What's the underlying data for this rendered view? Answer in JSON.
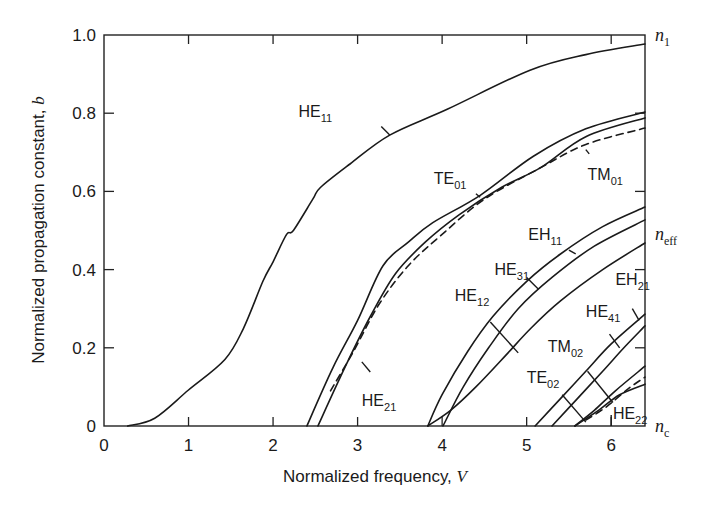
{
  "chart_data": {
    "type": "line",
    "title": "",
    "xlabel": "Normalized frequency, V",
    "ylabel": "Normalized propagation constant, b",
    "xlabel_parts": {
      "text": "Normalized frequency, ",
      "var": "V"
    },
    "ylabel_parts": {
      "text": "Normalized propagation constant, ",
      "var": "b"
    },
    "xlim": [
      0,
      6.4
    ],
    "ylim": [
      0,
      1.0
    ],
    "grid": false,
    "legend": "none (inline mode labels)",
    "x_ticks": [
      0,
      1,
      2,
      3,
      4,
      5,
      6
    ],
    "x_tick_labels": [
      "0",
      "1",
      "2",
      "3",
      "4",
      "5",
      "6"
    ],
    "y_ticks": [
      0,
      0.2,
      0.4,
      0.6,
      0.8,
      1.0
    ],
    "y_tick_labels": [
      "0",
      "0.2",
      "0.4",
      "0.6",
      "0.8",
      "1.0"
    ],
    "right_axis_labels": [
      {
        "base": "n",
        "sub": "1",
        "b": 1.0
      },
      {
        "base": "n",
        "sub": "eff",
        "b": 0.49
      },
      {
        "base": "n",
        "sub": "c",
        "b": 0.0
      }
    ],
    "series": [
      {
        "name": "HE11",
        "style": "solid",
        "cutoff_V": 0.28,
        "points": [
          [
            0.28,
            0
          ],
          [
            0.6,
            0.02
          ],
          [
            1.0,
            0.092
          ],
          [
            1.43,
            0.17
          ],
          [
            1.65,
            0.25
          ],
          [
            1.88,
            0.37
          ],
          [
            2.0,
            0.42
          ],
          [
            2.16,
            0.49
          ],
          [
            2.24,
            0.5
          ],
          [
            2.47,
            0.58
          ],
          [
            2.56,
            0.61
          ],
          [
            2.91,
            0.67
          ],
          [
            3.38,
            0.744
          ],
          [
            4.06,
            0.81
          ],
          [
            5.04,
            0.91
          ],
          [
            5.7,
            0.95
          ],
          [
            6.4,
            0.977
          ]
        ]
      },
      {
        "name": "TE01",
        "style": "solid",
        "cutoff_V": 2.4,
        "points": [
          [
            2.4,
            0
          ],
          [
            2.71,
            0.15
          ],
          [
            3.0,
            0.27
          ],
          [
            3.3,
            0.41
          ],
          [
            3.6,
            0.47
          ],
          [
            3.89,
            0.52
          ],
          [
            4.45,
            0.59
          ],
          [
            5.08,
            0.69
          ],
          [
            5.7,
            0.76
          ],
          [
            6.4,
            0.803
          ]
        ]
      },
      {
        "name": "HE21",
        "style": "solid",
        "cutoff_V": 2.53,
        "points": [
          [
            2.53,
            0
          ],
          [
            2.85,
            0.15
          ],
          [
            3.15,
            0.28
          ],
          [
            3.45,
            0.39
          ],
          [
            3.8,
            0.47
          ],
          [
            4.2,
            0.54
          ],
          [
            4.7,
            0.61
          ],
          [
            5.16,
            0.66
          ],
          [
            5.7,
            0.74
          ],
          [
            6.4,
            0.788
          ]
        ]
      },
      {
        "name": "TM01",
        "style": "dashed",
        "cutoff_V": 2.68,
        "points": [
          [
            2.68,
            0.09
          ],
          [
            2.95,
            0.19
          ],
          [
            3.25,
            0.31
          ],
          [
            3.6,
            0.41
          ],
          [
            4.0,
            0.49
          ],
          [
            4.5,
            0.58
          ],
          [
            5.16,
            0.66
          ],
          [
            5.7,
            0.72
          ],
          [
            6.4,
            0.762
          ]
        ]
      },
      {
        "name": "EH11",
        "style": "solid",
        "cutoff_V": 3.83,
        "points": [
          [
            3.83,
            0
          ],
          [
            4.0,
            0.08
          ],
          [
            4.3,
            0.19
          ],
          [
            4.6,
            0.28
          ],
          [
            5.0,
            0.37
          ],
          [
            5.4,
            0.44
          ],
          [
            5.9,
            0.51
          ],
          [
            6.4,
            0.56
          ]
        ]
      },
      {
        "name": "HE31",
        "style": "solid",
        "cutoff_V": 4.01,
        "points": [
          [
            4.01,
            0
          ],
          [
            4.25,
            0.1
          ],
          [
            4.55,
            0.2
          ],
          [
            4.9,
            0.3
          ],
          [
            5.3,
            0.38
          ],
          [
            5.8,
            0.46
          ],
          [
            6.4,
            0.527
          ]
        ]
      },
      {
        "name": "HE12",
        "style": "solid",
        "cutoff_V": 3.83,
        "points": [
          [
            3.83,
            0
          ],
          [
            4.1,
            0.04
          ],
          [
            4.4,
            0.1
          ],
          [
            4.75,
            0.18
          ],
          [
            5.05,
            0.25
          ],
          [
            5.4,
            0.32
          ],
          [
            5.9,
            0.4
          ],
          [
            6.4,
            0.468
          ]
        ]
      },
      {
        "name": "EH21",
        "style": "solid",
        "cutoff_V": 5.1,
        "points": [
          [
            5.1,
            0
          ],
          [
            5.4,
            0.07
          ],
          [
            5.7,
            0.14
          ],
          [
            6.0,
            0.21
          ],
          [
            6.4,
            0.286
          ]
        ]
      },
      {
        "name": "HE41",
        "style": "solid",
        "cutoff_V": 5.3,
        "points": [
          [
            5.3,
            0
          ],
          [
            5.6,
            0.07
          ],
          [
            5.9,
            0.14
          ],
          [
            6.15,
            0.2
          ],
          [
            6.4,
            0.256
          ]
        ]
      },
      {
        "name": "TM02",
        "style": "solid",
        "cutoff_V": 5.57,
        "points": [
          [
            5.57,
            0
          ],
          [
            5.8,
            0.04
          ],
          [
            6.05,
            0.09
          ],
          [
            6.4,
            0.153
          ]
        ]
      },
      {
        "name": "TE02",
        "style": "solid",
        "cutoff_V": 5.57,
        "points": [
          [
            5.57,
            0
          ],
          [
            5.85,
            0.04
          ],
          [
            6.1,
            0.08
          ],
          [
            6.4,
            0.107
          ]
        ]
      },
      {
        "name": "HE22",
        "style": "dashed",
        "cutoff_V": 5.7,
        "points": [
          [
            5.7,
            0.015
          ],
          [
            5.95,
            0.05
          ],
          [
            6.2,
            0.095
          ],
          [
            6.4,
            0.125
          ]
        ]
      }
    ],
    "annotations": [
      {
        "text": "HE11",
        "base": "HE",
        "sub": "11",
        "label_at": [
          2.3,
          0.79
        ],
        "leader": [
          [
            3.28,
            0.766
          ],
          [
            3.38,
            0.744
          ]
        ]
      },
      {
        "text": "TE01",
        "base": "TE",
        "sub": "01",
        "label_at": [
          3.9,
          0.62
        ],
        "leader": [
          [
            4.4,
            0.594
          ],
          [
            4.45,
            0.585
          ]
        ]
      },
      {
        "text": "TM01",
        "base": "TM",
        "sub": "01",
        "label_at": [
          5.72,
          0.63
        ],
        "leader": [
          [
            5.7,
            0.707
          ],
          [
            5.74,
            0.696
          ]
        ]
      },
      {
        "text": "HE21",
        "base": "HE",
        "sub": "21",
        "label_at": [
          3.05,
          0.05
        ],
        "leader": [
          [
            3.05,
            0.164
          ],
          [
            3.15,
            0.138
          ]
        ]
      },
      {
        "text": "EH11",
        "base": "EH",
        "sub": "11",
        "label_at": [
          5.02,
          0.475
        ],
        "leader": [
          [
            5.5,
            0.45
          ],
          [
            5.58,
            0.44
          ]
        ]
      },
      {
        "text": "HE31",
        "base": "HE",
        "sub": "31",
        "label_at": [
          4.62,
          0.385
        ],
        "leader": [
          [
            5.0,
            0.38
          ],
          [
            5.14,
            0.35
          ]
        ]
      },
      {
        "text": "HE12",
        "base": "HE",
        "sub": "12",
        "label_at": [
          4.15,
          0.32
        ],
        "leader": [
          [
            4.57,
            0.266
          ],
          [
            4.9,
            0.187
          ]
        ]
      },
      {
        "text": "EH21",
        "base": "EH",
        "sub": "21",
        "label_at": [
          6.05,
          0.36
        ],
        "leader": [
          [
            6.25,
            0.3
          ],
          [
            6.33,
            0.27
          ]
        ]
      },
      {
        "text": "HE41",
        "base": "HE",
        "sub": "41",
        "label_at": [
          5.7,
          0.28
        ],
        "leader": [
          [
            5.98,
            0.235
          ],
          [
            6.1,
            0.2
          ]
        ]
      },
      {
        "text": "TM02",
        "base": "TM",
        "sub": "02",
        "label_at": [
          5.25,
          0.19
        ],
        "leader": [
          [
            5.72,
            0.14
          ],
          [
            6.02,
            0.06
          ]
        ]
      },
      {
        "text": "TE02",
        "base": "TE",
        "sub": "02",
        "label_at": [
          5.0,
          0.11
        ],
        "leader": [
          [
            5.42,
            0.08
          ],
          [
            5.7,
            0.01
          ]
        ]
      },
      {
        "text": "HE22",
        "base": "HE",
        "sub": "22",
        "label_at": [
          6.02,
          0.018
        ],
        "leader": [
          [
            6.0,
            0.0
          ],
          [
            6.0,
            0.028
          ]
        ]
      }
    ]
  }
}
